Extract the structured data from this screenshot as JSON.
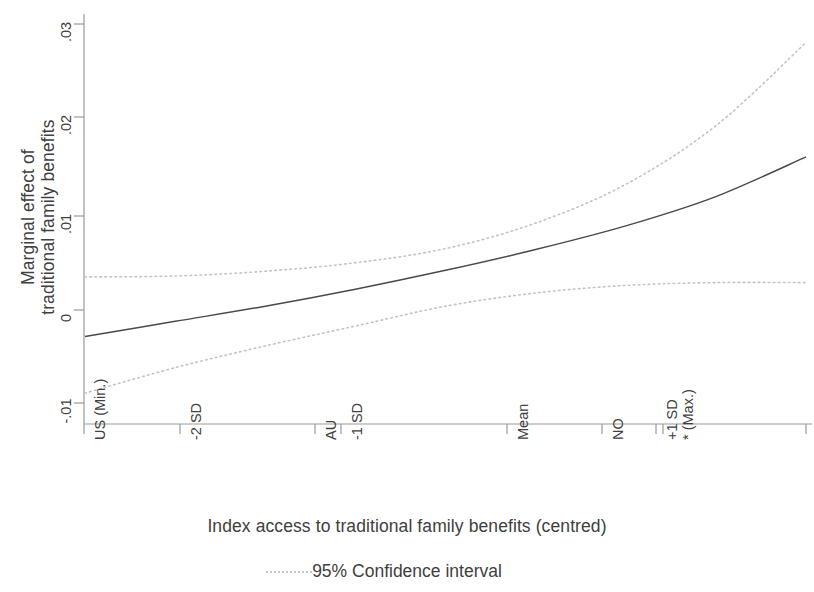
{
  "axes": {
    "y_title_line1": "Marginal effect of",
    "y_title_line2": "traditional family benefits",
    "x_title": "Index access to traditional family benefits (centred)",
    "y_ticks": [
      ".03",
      ".02",
      ".01",
      "0",
      "-.01"
    ],
    "x_ticks": [
      "US (Min.)",
      "-2 SD",
      "AU",
      "-1 SD",
      "Mean",
      "NO",
      "+1 SD",
      "* (Max.)",
      "+2 SD"
    ]
  },
  "legend": {
    "ci_label": "95% Confidence interval",
    "ci_marker": "dotted-line-icon"
  },
  "colors": {
    "line": "#4a4a4a",
    "ci": "#c0c0c0",
    "axis": "#9a9a9a",
    "text": "#404040"
  },
  "chart_data": {
    "type": "line",
    "title": "",
    "subtitle": "",
    "xlabel": "Index access to traditional family benefits (centred)",
    "ylabel": "Marginal effect of traditional family benefits",
    "xlim": [
      0,
      1
    ],
    "ylim": [
      -0.012,
      0.031
    ],
    "grid": false,
    "legend_position": "bottom",
    "y_tick_values": [
      0.03,
      0.02,
      0.01,
      0,
      -0.01
    ],
    "y_tick_labels": [
      ".03",
      ".02",
      ".01",
      "0",
      "-.01"
    ],
    "x_tick_positions": [
      0.0,
      0.132,
      0.321,
      0.356,
      0.585,
      0.717,
      0.793,
      0.803,
      1.0
    ],
    "x_tick_labels": [
      "US (Min.)",
      "-2 SD",
      "AU",
      "-1 SD",
      "Mean",
      "NO",
      "+1 SD",
      "* (Max.)",
      "+2 SD"
    ],
    "x": [
      0.0,
      0.125,
      0.25,
      0.375,
      0.5,
      0.625,
      0.75,
      0.875,
      1.0
    ],
    "series": [
      {
        "name": "Marginal effect",
        "style": "solid",
        "values": [
          -0.0028,
          -0.0012,
          0.0004,
          0.0022,
          0.0042,
          0.0064,
          0.0089,
          0.012,
          0.0162
        ]
      },
      {
        "name": "95% Confidence interval (upper)",
        "style": "dotted",
        "values": [
          0.0035,
          0.0036,
          0.0041,
          0.005,
          0.0065,
          0.0092,
          0.0133,
          0.0195,
          0.0283
        ]
      },
      {
        "name": "95% Confidence interval (lower)",
        "style": "dotted",
        "values": [
          -0.0088,
          -0.0061,
          -0.0038,
          -0.0017,
          0.0004,
          0.0018,
          0.0026,
          0.0029,
          0.0029
        ]
      }
    ]
  }
}
